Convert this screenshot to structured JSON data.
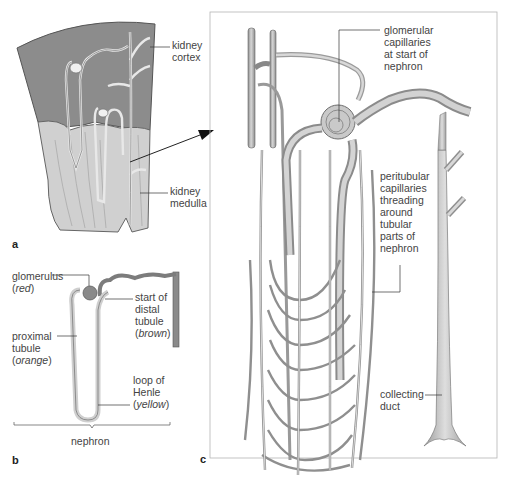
{
  "figure": {
    "panels": {
      "a": {
        "letter": "a",
        "labels": {
          "cortex": [
            "kidney",
            "cortex"
          ],
          "medulla": [
            "kidney",
            "medulla"
          ]
        }
      },
      "b": {
        "letter": "b",
        "labels": {
          "glomerulus": {
            "line1": "glomerulus",
            "paren_color": "red"
          },
          "distal": {
            "line1": "start of",
            "line2": "distal",
            "line3": "tubule",
            "paren_color": "brown"
          },
          "proximal": {
            "line1": "proximal",
            "line2": "tubule",
            "paren_color": "orange"
          },
          "henle": {
            "line1": "loop of",
            "line2": "Henle",
            "paren_color": "yellow"
          }
        },
        "bracket_label": "nephron"
      },
      "c": {
        "letter": "c",
        "labels": {
          "glomerular": [
            "glomerular",
            "capillaries",
            "at start of",
            "nephron"
          ],
          "peritubular": [
            "peritubular",
            "capillaries",
            "threading",
            "around",
            "tubular",
            "parts of",
            "nephron"
          ],
          "collecting": [
            "collecting",
            "duct"
          ]
        }
      }
    },
    "colors": {
      "cortex_fill": "#8a8a8a",
      "medulla_fill": "#cfcfcf",
      "tubule_fill": "#c4c4c4",
      "tubule_stroke": "#6d6d6d",
      "frame": "#b5b5b5",
      "leader": "#333333"
    }
  }
}
